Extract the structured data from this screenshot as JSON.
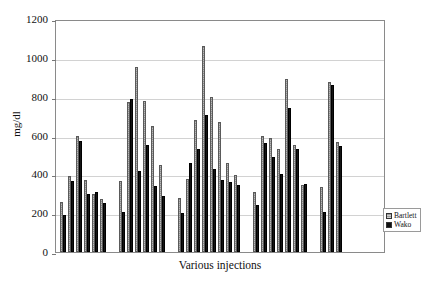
{
  "chart_data": {
    "type": "bar",
    "title": "",
    "xlabel": "Various injections",
    "ylabel": "mg/dl",
    "ylim": [
      0,
      1200
    ],
    "ytick_values": [
      0,
      200,
      400,
      600,
      800,
      1000,
      1200
    ],
    "ytick_labels": [
      "0",
      "200",
      "400",
      "600",
      "800",
      "1000",
      "1200"
    ],
    "grid": "horizontal",
    "legend_position": "right-bottom-outside",
    "xtick_labels": [],
    "categories": [
      "1",
      "2",
      "3",
      "4",
      "5",
      "6",
      "7",
      "8",
      "9",
      "10",
      "11",
      "12",
      "13",
      "14",
      "15",
      "16",
      "17",
      "18",
      "19",
      "20",
      "21",
      "22",
      "23",
      "24",
      "25",
      "26",
      "27",
      "28",
      "29",
      "30"
    ],
    "series": [
      {
        "name": "Bartlett",
        "color": "#9a9a9a",
        "pattern": "hatched",
        "values": [
          260,
          390,
          600,
          370,
          300,
          275,
          365,
          775,
          955,
          780,
          650,
          450,
          280,
          375,
          680,
          1060,
          800,
          670,
          460,
          395,
          310,
          600,
          585,
          530,
          890,
          550,
          345,
          335,
          875,
          565
        ]
      },
      {
        "name": "Wako",
        "color": "#141414",
        "pattern": "solid",
        "values": [
          190,
          365,
          570,
          300,
          310,
          255,
          205,
          790,
          415,
          550,
          340,
          290,
          200,
          460,
          530,
          705,
          425,
          370,
          360,
          345,
          240,
          560,
          490,
          400,
          740,
          530,
          350,
          205,
          860,
          545
        ]
      }
    ],
    "group_breaks": [
      6,
      12,
      20,
      27
    ]
  },
  "legend": {
    "items": [
      {
        "label": "Bartlett"
      },
      {
        "label": "Wako"
      }
    ]
  }
}
